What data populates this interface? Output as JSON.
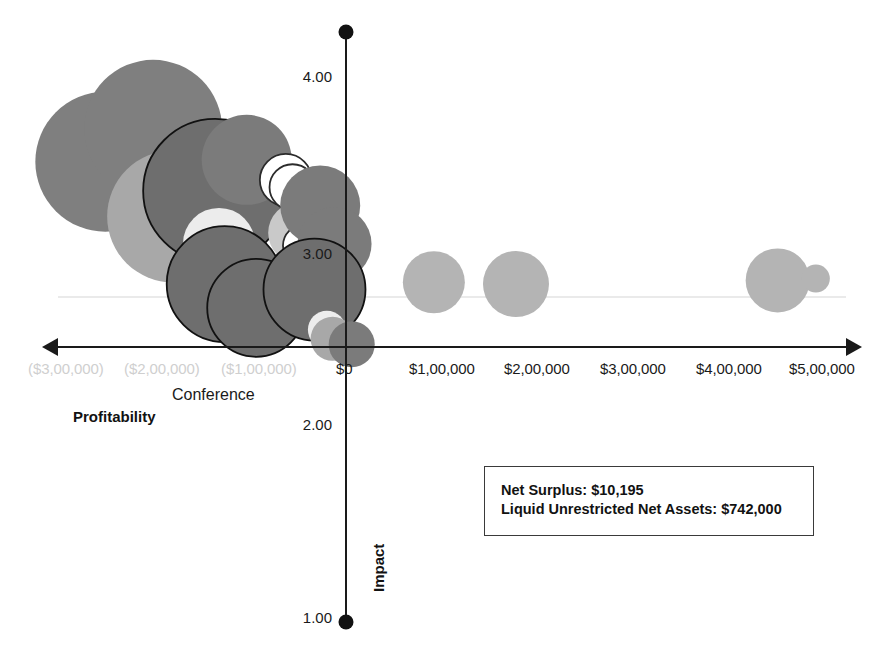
{
  "chart_data": {
    "type": "scatter",
    "title": "",
    "xlabel": "Profitability",
    "ylabel": "Impact",
    "xlim": [
      -350000,
      530000
    ],
    "ylim": [
      1.0,
      4.35
    ],
    "grid": false,
    "legend_position": "none",
    "x_tick_labels": [
      "($3,00,000)",
      "($2,00,000)",
      "($1,00,000)",
      "$0",
      "$1,00,000",
      "$2,00,000",
      "$3,00,000",
      "$4,00,000",
      "$5,00,000"
    ],
    "x_tick_values": [
      -300000,
      -200000,
      -100000,
      0,
      100000,
      200000,
      300000,
      400000,
      500000
    ],
    "y_tick_labels": [
      "1.00",
      "2.00",
      "3.00",
      "4.00"
    ],
    "y_tick_values": [
      1.0,
      2.0,
      3.0,
      4.0
    ],
    "annotations": [
      {
        "text": "Conference",
        "x": -150000,
        "y": 2.72
      }
    ],
    "points": [
      {
        "x": -252000,
        "y": 3.52,
        "size": 70,
        "fill": "#7f7f7f",
        "stroke": "none"
      },
      {
        "x": -202000,
        "y": 3.7,
        "size": 69,
        "fill": "#7f7f7f",
        "stroke": "none"
      },
      {
        "x": -181000,
        "y": 3.22,
        "size": 66,
        "fill": "#a8a8a8",
        "stroke": "none"
      },
      {
        "x": -137000,
        "y": 3.36,
        "size": 72,
        "fill": "#6e6e6e",
        "stroke": "#111111"
      },
      {
        "x": -104000,
        "y": 3.53,
        "size": 45,
        "fill": "#7b7b7b",
        "stroke": "none"
      },
      {
        "x": -133000,
        "y": 3.07,
        "size": 36,
        "fill": "#ececec",
        "stroke": "none"
      },
      {
        "x": -127000,
        "y": 2.85,
        "size": 58,
        "fill": "#6e6e6e",
        "stroke": "#111111"
      },
      {
        "x": -94000,
        "y": 2.72,
        "size": 49,
        "fill": "#6e6e6e",
        "stroke": "#111111"
      },
      {
        "x": -63000,
        "y": 3.42,
        "size": 26,
        "fill": "#ffffff",
        "stroke": "#2b2b2b"
      },
      {
        "x": -56000,
        "y": 3.38,
        "size": 23,
        "fill": "#ffffff",
        "stroke": "#2b2b2b"
      },
      {
        "x": -49000,
        "y": 3.13,
        "size": 31,
        "fill": "#c9c9c9",
        "stroke": "none"
      },
      {
        "x": -44000,
        "y": 3.06,
        "size": 21,
        "fill": "#ffffff",
        "stroke": "#2b2b2b"
      },
      {
        "x": -27000,
        "y": 3.28,
        "size": 40,
        "fill": "#7b7b7b",
        "stroke": "none"
      },
      {
        "x": -12000,
        "y": 3.07,
        "size": 37,
        "fill": "#7b7b7b",
        "stroke": "none"
      },
      {
        "x": -33000,
        "y": 2.82,
        "size": 51,
        "fill": "#6e6e6e",
        "stroke": "#111111"
      },
      {
        "x": -20000,
        "y": 2.6,
        "size": 19,
        "fill": "#ededed",
        "stroke": "none"
      },
      {
        "x": -14000,
        "y": 2.55,
        "size": 22,
        "fill": "#a8a8a8",
        "stroke": "none"
      },
      {
        "x": 6000,
        "y": 2.52,
        "size": 23,
        "fill": "#7b7b7b",
        "stroke": "none"
      },
      {
        "x": 92000,
        "y": 2.86,
        "size": 31,
        "fill": "#b4b4b4",
        "stroke": "none"
      },
      {
        "x": 178000,
        "y": 2.85,
        "size": 33,
        "fill": "#b4b4b4",
        "stroke": "none"
      },
      {
        "x": 452000,
        "y": 2.87,
        "size": 32,
        "fill": "#b4b4b4",
        "stroke": "none"
      },
      {
        "x": 492000,
        "y": 2.88,
        "size": 14,
        "fill": "#b4b4b4",
        "stroke": "none"
      }
    ]
  },
  "info_box": {
    "line1": "Net Surplus: $10,195",
    "line2": "Liquid Unrestricted Net Assets: $742,000"
  },
  "axes": {
    "x_title": "Profitability",
    "y_title": "Impact"
  }
}
